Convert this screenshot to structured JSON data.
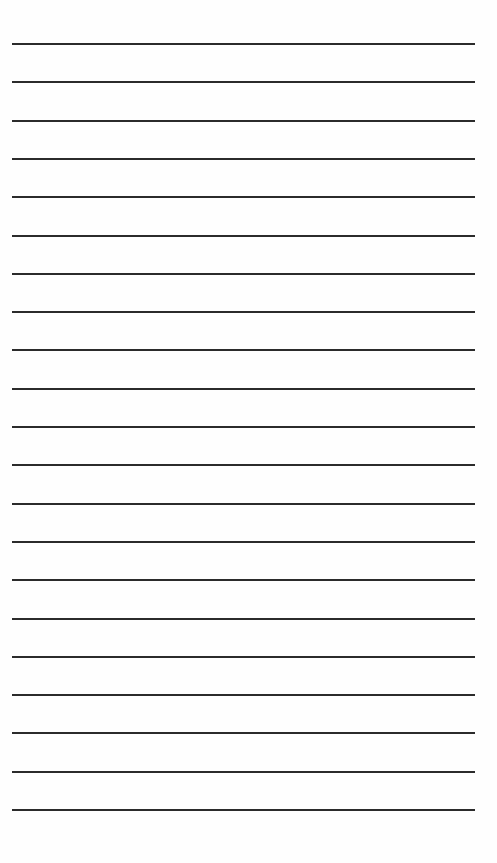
{
  "page": {
    "type": "lined-paper",
    "line_count": 21,
    "first_line_y": 43,
    "line_spacing": 38.3,
    "line_left": 12,
    "line_width": 463,
    "line_color": "#2b2b2b",
    "background": "#fefefe"
  }
}
